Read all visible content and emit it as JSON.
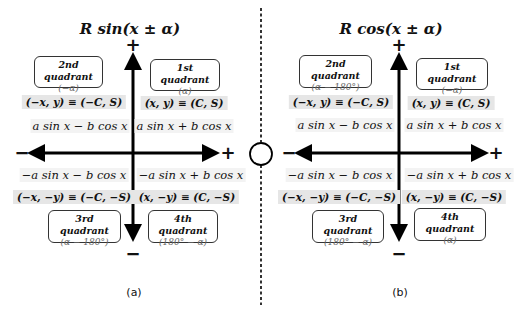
{
  "panels": [
    {
      "title": "R sin(x ± α)",
      "caption": "(a)",
      "quadrants": {
        "q1": {
          "name": "1st quadrant",
          "angle": "(α)",
          "coord": "(x, y) ≡ (C, S)",
          "expr": "a sin x + b cos x"
        },
        "q2": {
          "name": "2nd quadrant",
          "angle": "(−α)",
          "coord": "(−x, y) ≡ (−C, S)",
          "expr": "a sin x − b cos x"
        },
        "q3": {
          "name": "3rd quadrant",
          "angle": "(α − 180°)",
          "coord": "(−x, −y) ≡ (−C, −S)",
          "expr": "−a sin x − b cos x"
        },
        "q4": {
          "name": "4th quadrant",
          "angle": "(180° − α)",
          "coord": "(x, −y) ≡ (C, −S)",
          "expr": "−a sin x + b cos x"
        }
      }
    },
    {
      "title": "R cos(x ± α)",
      "caption": "(b)",
      "quadrants": {
        "q1": {
          "name": "1st quadrant",
          "angle": "(−α)",
          "coord": "(x, y) ≡ (C, S)",
          "expr": "a sin x + b cos x"
        },
        "q2": {
          "name": "2nd quadrant",
          "angle": "(α − 180°)",
          "coord": "(−x, y) ≡ (−C, S)",
          "expr": "a sin x − b cos x"
        },
        "q3": {
          "name": "3rd quadrant",
          "angle": "(180° − α)",
          "coord": "(−x, −y) ≡ (−C, −S)",
          "expr": "−a sin x − b cos x"
        },
        "q4": {
          "name": "4th quadrant",
          "angle": "(α)",
          "coord": "(x, −y) ≡ (C, −S)",
          "expr": "−a sin x + b cos x"
        }
      }
    }
  ],
  "signs": {
    "plus": "+",
    "minus": "−"
  }
}
